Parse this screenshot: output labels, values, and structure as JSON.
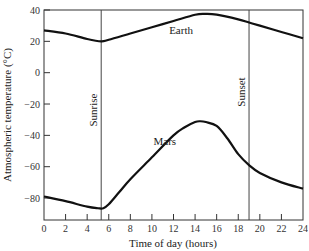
{
  "chart_data": {
    "type": "line",
    "title": "",
    "xlabel": "Time of day (hours)",
    "ylabel": "Atmospheric temperature (°C)",
    "xlim": [
      0,
      24
    ],
    "ylim": [
      -94,
      40
    ],
    "x_ticks": [
      0,
      2,
      4,
      6,
      8,
      10,
      12,
      14,
      16,
      18,
      20,
      22,
      24
    ],
    "y_ticks": [
      40,
      20,
      0,
      -20,
      -40,
      -60,
      -80
    ],
    "y_tick_labels": [
      "40",
      "20",
      "0",
      "−20",
      "−40",
      "−60",
      "−80"
    ],
    "grid": false,
    "legend": "none (inline labels)",
    "series": [
      {
        "name": "Earth",
        "x": [
          0,
          2,
          4,
          5.3,
          6,
          8,
          10,
          12,
          14,
          15,
          16,
          18,
          19,
          20,
          22,
          24
        ],
        "values": [
          27,
          25,
          21.5,
          20,
          21,
          25,
          29,
          33,
          37,
          37.5,
          37,
          34,
          32,
          30,
          26,
          22
        ]
      },
      {
        "name": "Mars",
        "x": [
          0,
          2,
          4,
          5,
          5.5,
          6,
          7,
          8,
          10,
          12,
          13,
          14,
          14.5,
          15,
          16,
          17,
          18,
          19,
          20,
          22,
          24
        ],
        "values": [
          -79,
          -82,
          -85.5,
          -86.5,
          -86.5,
          -84,
          -76,
          -68,
          -54,
          -40,
          -35,
          -31.5,
          -31,
          -31.5,
          -34,
          -42,
          -52,
          -59,
          -64,
          -70,
          -74
        ]
      }
    ],
    "annotations": [
      {
        "text": "Sunrise",
        "x": 5.3,
        "type": "vertical-line"
      },
      {
        "text": "Sunset",
        "x": 19,
        "type": "vertical-line"
      },
      {
        "text": "Earth",
        "x": 12.7,
        "y": 25,
        "type": "series-label"
      },
      {
        "text": "Mars",
        "x": 11.2,
        "y": -46,
        "type": "series-label"
      }
    ]
  }
}
